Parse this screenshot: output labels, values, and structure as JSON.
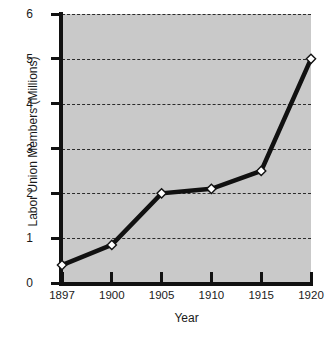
{
  "chart_data": {
    "type": "line",
    "title": "",
    "xlabel": "Year",
    "ylabel": "Labor Union Members (Millions)",
    "categories": [
      "1897",
      "1900",
      "1905",
      "1910",
      "1915",
      "1920"
    ],
    "x": [
      1897,
      1900,
      1905,
      1910,
      1915,
      1920
    ],
    "values": [
      0.4,
      0.85,
      2.0,
      2.1,
      2.5,
      5.0
    ],
    "series": [
      {
        "name": "Labor Union Members",
        "values": [
          0.4,
          0.85,
          2.0,
          2.1,
          2.5,
          5.0
        ]
      }
    ],
    "ylim": [
      0,
      6
    ],
    "yticks": [
      0,
      1,
      2,
      3,
      4,
      5,
      6
    ],
    "ytick_labels": [
      "0",
      "1",
      "2",
      "3",
      "4",
      "5",
      "6"
    ],
    "xtick_labels": [
      "1897",
      "1900",
      "1905",
      "1910",
      "1915",
      "1920"
    ],
    "grid": "horizontal-dashed",
    "legend": "none",
    "marker": "diamond",
    "marker_face_color": "#ffffff",
    "marker_edge_color": "#111111",
    "line_color": "#111111",
    "plot_background": "#c9c9c9",
    "figure_background": "#ffffff"
  }
}
